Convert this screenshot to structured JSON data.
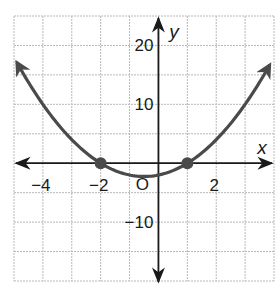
{
  "chart_data": {
    "type": "line",
    "title": "",
    "function": "y = x^2 + x - 2",
    "xlabel": "x",
    "ylabel": "y",
    "xlim": [
      -5,
      4
    ],
    "ylim": [
      -20,
      25
    ],
    "grid": true,
    "grid_step": {
      "x": 1,
      "y": 5
    },
    "x_ticks": [
      {
        "value": -4,
        "label": "−4"
      },
      {
        "value": -2,
        "label": "−2"
      },
      {
        "value": 2,
        "label": "2"
      }
    ],
    "y_ticks": [
      {
        "value": 20,
        "label": "20"
      },
      {
        "value": 10,
        "label": "10"
      },
      {
        "value": -10,
        "label": "−10"
      }
    ],
    "origin_label": "O",
    "curve_color": "#4a4a4a",
    "points": [
      {
        "x": -2,
        "y": 0
      },
      {
        "x": 1,
        "y": 0
      }
    ],
    "series": [
      {
        "name": "parabola",
        "x": [
          -4.9,
          -4,
          -3,
          -2,
          -1,
          -0.5,
          0,
          1,
          2,
          3,
          3.85
        ],
        "values": [
          17.1,
          10,
          4,
          0,
          -2,
          -2.25,
          -2,
          0,
          4,
          10,
          16.7
        ]
      }
    ]
  }
}
